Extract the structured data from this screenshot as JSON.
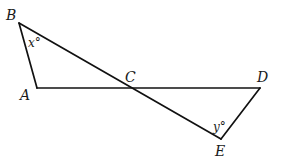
{
  "diagram": {
    "type": "geometry",
    "points": {
      "A": {
        "label": "A",
        "x": 37,
        "y": 88
      },
      "B": {
        "label": "B",
        "x": 19,
        "y": 23
      },
      "C": {
        "label": "C",
        "x": 131,
        "y": 88
      },
      "D": {
        "label": "D",
        "x": 260,
        "y": 88
      },
      "E": {
        "label": "E",
        "x": 221,
        "y": 139
      }
    },
    "segments": [
      {
        "from": "A",
        "to": "B"
      },
      {
        "from": "B",
        "to": "E",
        "through": "C"
      },
      {
        "from": "A",
        "to": "D",
        "through": "C"
      },
      {
        "from": "D",
        "to": "E"
      }
    ],
    "labels": {
      "A": "A",
      "B": "B",
      "C": "C",
      "D": "D",
      "E": "E"
    },
    "angles": {
      "x": {
        "vertex": "B",
        "text": "x°"
      },
      "y": {
        "vertex": "E",
        "text": "y°"
      }
    },
    "colors": {
      "stroke": "#111111",
      "text": "#1a1a1a",
      "background": "#ffffff"
    }
  }
}
